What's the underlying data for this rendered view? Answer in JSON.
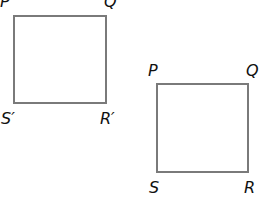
{
  "diagram": {
    "image_square": {
      "labels": {
        "top_left": "P′",
        "top_right": "Q′",
        "bottom_left": "S′",
        "bottom_right": "R′"
      }
    },
    "original_square": {
      "labels": {
        "top_left": "P",
        "top_right": "Q",
        "bottom_left": "S",
        "bottom_right": "R"
      }
    },
    "stroke_color": "#7a7a7a"
  }
}
